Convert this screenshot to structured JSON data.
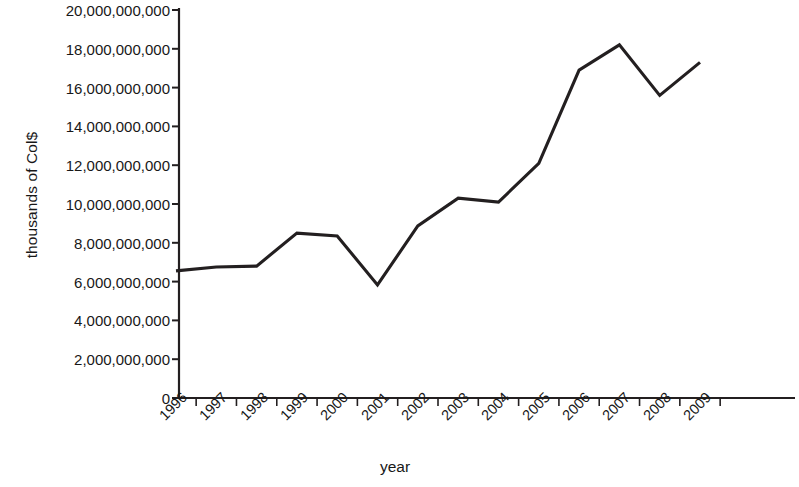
{
  "chart_data": {
    "type": "line",
    "title": "",
    "xlabel": "year",
    "ylabel": "thousands  of Col$",
    "categories": [
      "1996",
      "1997",
      "1998",
      "1999",
      "2000",
      "2001",
      "2002",
      "2003",
      "2004",
      "2005",
      "2006",
      "2007",
      "2008",
      "2009"
    ],
    "values": [
      6550000000,
      6750000000,
      6800000000,
      8500000000,
      8350000000,
      5830000000,
      8870000000,
      10300000000,
      10100000000,
      12100000000,
      16900000000,
      18200000000,
      15600000000,
      17300000000
    ],
    "ylim": [
      0,
      20000000000
    ],
    "ytick_values": [
      0,
      2000000000,
      4000000000,
      6000000000,
      8000000000,
      10000000000,
      12000000000,
      14000000000,
      16000000000,
      18000000000,
      20000000000
    ],
    "ytick_labels": [
      "0",
      "2,000,000,000",
      "4,000,000,000",
      "6,000,000,000",
      "8,000,000,000",
      "10,000,000,000",
      "12,000,000,000",
      "14,000,000,000",
      "16,000,000,000",
      "18,000,000,000",
      "20,000,000,000"
    ],
    "grid": false,
    "legend": false,
    "legend_position": "none",
    "series": [
      {
        "name": "",
        "color": "#231f20",
        "values": [
          6550000000,
          6750000000,
          6800000000,
          8500000000,
          8350000000,
          5830000000,
          8870000000,
          10300000000,
          10100000000,
          12100000000,
          16900000000,
          18200000000,
          15600000000,
          17300000000
        ]
      }
    ],
    "axis_color": "#231f20",
    "line_color": "#231f20",
    "background_color": "#ffffff"
  }
}
